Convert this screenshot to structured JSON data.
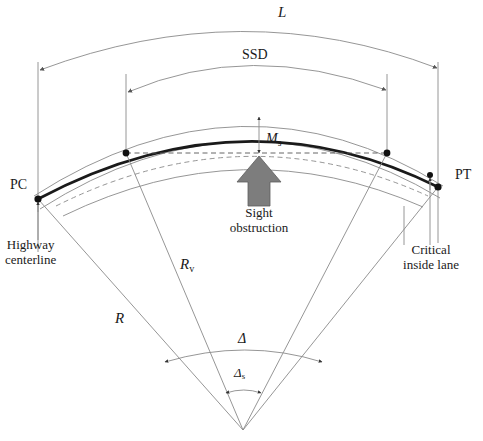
{
  "diagram": {
    "labels": {
      "curve_length": "L",
      "sight_distance": "SSD",
      "middle_ordinate": "M",
      "middle_ordinate_sub": "s",
      "point_of_curvature": "PC",
      "point_of_tangency": "PT",
      "highway_centerline": "Highway\ncenterline",
      "highway_centerline_line1": "Highway",
      "highway_centerline_line2": "centerline",
      "sight_obstruction_line1": "Sight",
      "sight_obstruction_line2": "obstruction",
      "critical_inside_lane_line1": "Critical",
      "critical_inside_lane_line2": "inside lane",
      "radius_centerline": "R",
      "radius_inside_lane": "R",
      "radius_inside_lane_sub": "v",
      "central_angle": "Δ",
      "sight_angle": "Δ",
      "sight_angle_sub": "s"
    },
    "colors": {
      "background": "#ffffff",
      "thin_stroke": "#8a8a8a",
      "heavy_stroke": "#1a1a1a",
      "obstruction_fill": "#7d7d7d",
      "text": "#1a1a1a"
    },
    "geometry": {
      "center_x": 243,
      "center_y": 432,
      "pc_x": 38,
      "pc_y": 199,
      "pt_x": 438,
      "pt_y": 187
    }
  }
}
